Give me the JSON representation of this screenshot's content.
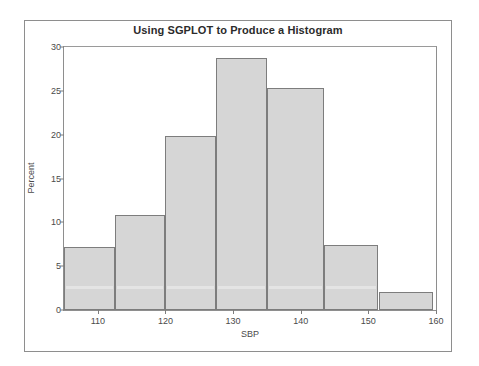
{
  "top_clip_text": "",
  "figure": {
    "title": "Using SGPLOT to Produce a Histogram",
    "xlabel": "SBP",
    "ylabel": "Percent"
  },
  "chart_data": {
    "type": "bar",
    "title": "Using SGPLOT to Produce a Histogram",
    "subtitle": "",
    "xlabel": "SBP",
    "ylabel": "Percent",
    "xlim": [
      105,
      160
    ],
    "ylim": [
      0,
      30
    ],
    "grid": false,
    "legend": null,
    "bin_width": 7.5,
    "bar_fill_color": "#d6d6d6",
    "bar_edge_color": "#7d7d7d",
    "axis_color": "#8e8e8e",
    "text_color": "#4a4a4a",
    "xticks": [
      110,
      120,
      130,
      140,
      150,
      160
    ],
    "yticks": [
      0,
      5,
      10,
      15,
      20,
      25,
      30
    ],
    "bins": [
      {
        "left": 105.0,
        "right": 112.5,
        "center": 108.75,
        "value": 7.2
      },
      {
        "left": 112.5,
        "right": 120.0,
        "center": 116.25,
        "value": 10.8
      },
      {
        "left": 120.0,
        "right": 127.5,
        "center": 123.75,
        "value": 19.8
      },
      {
        "left": 127.5,
        "right": 135.0,
        "center": 131.25,
        "value": 28.8
      },
      {
        "left": 135.0,
        "right": 143.5,
        "center": 139.25,
        "value": 25.3
      },
      {
        "left": 143.5,
        "right": 151.5,
        "center": 147.5,
        "value": 7.4
      },
      {
        "left": 151.5,
        "right": 159.5,
        "center": 155.5,
        "value": 2.0
      }
    ],
    "categories": [
      "105-112.5",
      "112.5-120",
      "120-127.5",
      "127.5-135",
      "135-143.5",
      "143.5-151.5",
      "151.5-159.5"
    ],
    "values": [
      7.2,
      10.8,
      19.8,
      28.8,
      25.3,
      7.4,
      2.0
    ]
  }
}
